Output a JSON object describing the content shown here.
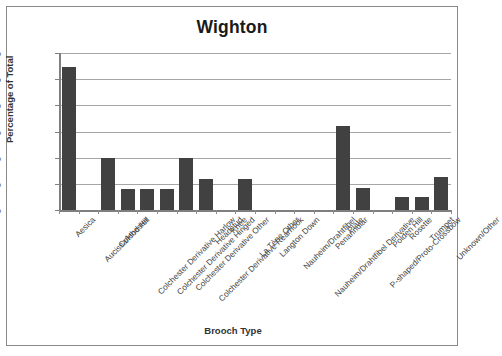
{
  "chart_data": {
    "type": "bar",
    "title": "Wighton",
    "xlabel": "Brooch Type",
    "ylabel": "Percentage of Total",
    "ylim": [
      0,
      30
    ],
    "ytick_labels": [
      "0%",
      "5%",
      "10%",
      "15%",
      "20%",
      "25%",
      "30%"
    ],
    "ytick_values": [
      0,
      5,
      10,
      15,
      20,
      25,
      30
    ],
    "grid": true,
    "legend": false,
    "bar_color": "#414141",
    "categories": [
      "Aesica",
      "Aucissa/Hod Hill",
      "Colchester",
      "Colchester Derivative Harlow",
      "Colchester Derivative Hinged",
      "Colchester Derivative Other",
      "Colchester Derivative Rearhook",
      "Headstud",
      "Knee",
      "La Tène Other",
      "Langton Down",
      "Nauheim/Drahtfibel",
      "Nauheim/Drahtfibel Derivative",
      "Penannular",
      "Plate",
      "P-shaped/Proto-Crossbow",
      "Polden Hill",
      "Rosette",
      "Trumpet",
      "Unknown/Other"
    ],
    "values": [
      27.3,
      0,
      10,
      4,
      4,
      4,
      10,
      6,
      0,
      6,
      0,
      0,
      0,
      0,
      16,
      4.3,
      0,
      2.5,
      2.5,
      6.3
    ]
  }
}
